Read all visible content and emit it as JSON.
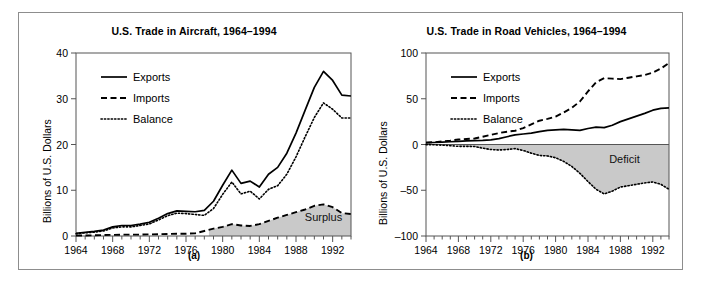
{
  "figure": {
    "background": "#ffffff",
    "frame_color": "#8d8d8d",
    "shade_color": "#c9c9c9",
    "line_color": "#000000"
  },
  "chart_data": [
    {
      "type": "line",
      "panel": "a",
      "caption": "(a)",
      "title": "U.S. Trade in Aircraft, 1964–1994",
      "xlabel": "",
      "ylabel": "Billions of U.S. Dollars",
      "xlim": [
        1964,
        1994
      ],
      "ylim": [
        0,
        40
      ],
      "yticks": [
        0,
        10,
        20,
        30,
        40
      ],
      "ytick_labels": [
        "0",
        "10",
        "20",
        "30",
        "40"
      ],
      "xticks": [
        1964,
        1968,
        1972,
        1976,
        1980,
        1984,
        1988,
        1992
      ],
      "xtick_labels": [
        "1964",
        "1968",
        "1972",
        "1976",
        "1980",
        "1984",
        "1988",
        "1992"
      ],
      "minor_xticks_every": 1,
      "grid": false,
      "legend": [
        "Exports",
        "Imports",
        "Balance"
      ],
      "legend_position": "upper left",
      "annotations": [
        {
          "text": "Surplus",
          "x": 1991.0,
          "y": 3.2
        }
      ],
      "shaded_region": {
        "label": "Surplus",
        "between": [
          "zero",
          "Imports"
        ],
        "from_x": 1978.5,
        "color": "#c9c9c9"
      },
      "x": [
        1964,
        1965,
        1966,
        1967,
        1968,
        1969,
        1970,
        1971,
        1972,
        1973,
        1974,
        1975,
        1976,
        1977,
        1978,
        1979,
        1980,
        1981,
        1982,
        1983,
        1984,
        1985,
        1986,
        1987,
        1988,
        1989,
        1990,
        1991,
        1992,
        1993,
        1994
      ],
      "series": [
        {
          "name": "Exports",
          "style": "solid",
          "values": [
            0.6,
            0.8,
            1.0,
            1.3,
            2.0,
            2.3,
            2.3,
            2.6,
            3.0,
            3.9,
            4.9,
            5.5,
            5.4,
            5.3,
            5.6,
            7.6,
            11.1,
            14.4,
            11.5,
            12.0,
            10.7,
            13.5,
            15.0,
            18.1,
            22.5,
            27.5,
            32.5,
            36.0,
            34.0,
            30.8,
            30.6
          ]
        },
        {
          "name": "Imports",
          "style": "dashed",
          "values": [
            0.1,
            0.1,
            0.15,
            0.2,
            0.25,
            0.3,
            0.3,
            0.3,
            0.35,
            0.4,
            0.45,
            0.5,
            0.5,
            0.6,
            1.1,
            1.6,
            2.0,
            2.6,
            2.3,
            2.2,
            2.6,
            3.3,
            4.0,
            4.6,
            5.2,
            5.8,
            6.6,
            6.9,
            6.3,
            5.0,
            4.8
          ]
        },
        {
          "name": "Balance",
          "style": "dotted",
          "values": [
            0.5,
            0.7,
            0.85,
            1.1,
            1.75,
            2.0,
            2.0,
            2.3,
            2.65,
            3.5,
            4.45,
            5.0,
            4.9,
            4.7,
            4.5,
            6.0,
            9.1,
            11.8,
            9.2,
            9.8,
            8.1,
            10.2,
            11.0,
            13.5,
            17.3,
            21.7,
            25.9,
            29.1,
            27.7,
            25.8,
            25.8
          ]
        }
      ]
    },
    {
      "type": "line",
      "panel": "b",
      "caption": "(b)",
      "title": "U.S. Trade in Road Vehicles, 1964–1994",
      "xlabel": "",
      "ylabel": "Billions of U.S. Dollars",
      "xlim": [
        1964,
        1994
      ],
      "ylim": [
        -100,
        100
      ],
      "yticks": [
        -100,
        -50,
        0,
        50,
        100
      ],
      "ytick_labels": [
        "–100",
        "–50",
        "0",
        "50",
        "100"
      ],
      "xticks": [
        1964,
        1968,
        1972,
        1976,
        1980,
        1984,
        1988,
        1992
      ],
      "xtick_labels": [
        "1964",
        "1968",
        "1972",
        "1976",
        "1980",
        "1984",
        "1988",
        "1992"
      ],
      "minor_xticks_every": 1,
      "grid": false,
      "legend": [
        "Exports",
        "Imports",
        "Balance"
      ],
      "legend_position": "upper left",
      "annotations": [
        {
          "text": "Deficit",
          "x": 1988.5,
          "y": -20
        }
      ],
      "shaded_region": {
        "label": "Deficit",
        "between": [
          "zero",
          "Balance"
        ],
        "from_x": 1968.0,
        "color": "#c9c9c9"
      },
      "x": [
        1964,
        1965,
        1966,
        1967,
        1968,
        1969,
        1970,
        1971,
        1972,
        1973,
        1974,
        1975,
        1976,
        1977,
        1978,
        1979,
        1980,
        1981,
        1982,
        1983,
        1984,
        1985,
        1986,
        1987,
        1988,
        1989,
        1990,
        1991,
        1992,
        1993,
        1994
      ],
      "series": [
        {
          "name": "Exports",
          "style": "solid",
          "values": [
            2.0,
            2.2,
            2.6,
            3.0,
            3.5,
            4.0,
            4.3,
            4.5,
            5.0,
            6.5,
            8.5,
            10.5,
            11.5,
            12.5,
            14.0,
            15.5,
            16.0,
            16.5,
            16.0,
            15.5,
            17.5,
            19.0,
            18.5,
            21.0,
            25.0,
            28.0,
            31.0,
            34.0,
            37.5,
            39.5,
            40.0
          ]
        },
        {
          "name": "Imports",
          "style": "dashed",
          "values": [
            2.1,
            2.5,
            3.3,
            4.3,
            5.5,
            6.0,
            6.5,
            8.5,
            10.5,
            12.5,
            14.0,
            15.0,
            18.0,
            22.0,
            26.0,
            28.0,
            30.5,
            35.0,
            40.0,
            47.0,
            58.0,
            68.0,
            72.5,
            72.0,
            71.5,
            73.0,
            74.5,
            76.0,
            78.5,
            83.0,
            89.0
          ]
        },
        {
          "name": "Balance",
          "style": "dotted",
          "values": [
            -0.1,
            -0.3,
            -0.7,
            -1.3,
            -2.0,
            -2.0,
            -2.2,
            -4.0,
            -5.5,
            -6.0,
            -5.5,
            -4.5,
            -6.5,
            -9.5,
            -12.0,
            -12.5,
            -14.5,
            -18.5,
            -24.0,
            -31.5,
            -40.5,
            -49.0,
            -54.0,
            -51.0,
            -46.5,
            -45.0,
            -43.5,
            -42.0,
            -41.0,
            -43.5,
            -49.0
          ]
        }
      ]
    }
  ]
}
